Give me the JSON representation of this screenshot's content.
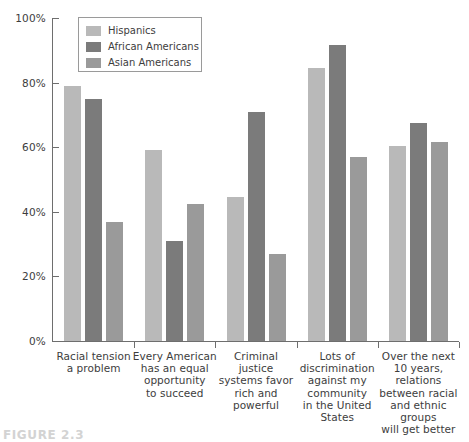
{
  "caption": "FIGURE 2.3",
  "legend": {
    "position": "top-left-inside",
    "entries": [
      {
        "label": "Hispanics",
        "color": "#b9b9b9"
      },
      {
        "label": "African Americans",
        "color": "#7b7b7b"
      },
      {
        "label": "Asian Americans",
        "color": "#9a9a9a"
      }
    ]
  },
  "chart_data": {
    "type": "bar",
    "title": "",
    "xlabel": "",
    "ylabel": "",
    "ylim": [
      0,
      100
    ],
    "ytick_labels": [
      "0%",
      "20%",
      "40%",
      "60%",
      "80%",
      "100%"
    ],
    "ytick_values": [
      0,
      20,
      40,
      60,
      80,
      100
    ],
    "grid": false,
    "legend_position": "top-left-inside",
    "categories": [
      "Racial tension\na problem",
      "Every American\nhas an equal\nopportunity\nto succeed",
      "Criminal\njustice\nsystems favor\nrich and\npowerful",
      "Lots of\ndiscrimination\nagainst my\ncommunity\nin the United\nStates",
      "Over the next\n10 years,\nrelations\nbetween racial\nand ethnic\ngroups\nwill get better"
    ],
    "series": [
      {
        "name": "Hispanics",
        "color": "#b9b9b9",
        "values": [
          79,
          59,
          44.5,
          84.5,
          60.5
        ]
      },
      {
        "name": "African Americans",
        "color": "#7b7b7b",
        "values": [
          75,
          31,
          71,
          91.5,
          67.5
        ]
      },
      {
        "name": "Asian Americans",
        "color": "#9a9a9a",
        "values": [
          37,
          42.5,
          27,
          57,
          61.5
        ]
      }
    ]
  }
}
